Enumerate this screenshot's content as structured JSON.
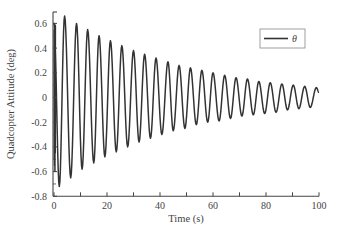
{
  "chart_data": {
    "type": "line",
    "title": "",
    "xlabel": "Time (s)",
    "ylabel": "Quadcopter Attitude (deg)",
    "xlim": [
      0,
      100
    ],
    "ylim": [
      -0.8,
      0.7
    ],
    "xticks": [
      0,
      20,
      40,
      60,
      80,
      100
    ],
    "xticks_minor_step": 10,
    "yticks": [
      0.6,
      0.4,
      0.2,
      0,
      -0.2,
      -0.4,
      -0.6,
      -0.8
    ],
    "xtick_labels": [
      "0",
      "20",
      "40",
      "60",
      "80",
      "100"
    ],
    "ytick_labels": [
      "0.6",
      "0.4",
      "0.2",
      "0",
      "-0.2",
      "-0.4",
      "-0.6",
      "-0.8"
    ],
    "grid": false,
    "legend_position": "upper right",
    "series": [
      {
        "name": "θ",
        "color": "#333333",
        "model": "damped sinusoid: y ≈ 0.72·e^(-0.023 t)·cos(2π t/4.3 + 2.55), with initial transient near t=0",
        "peaks": [
          [
            4,
            0.66
          ],
          [
            8.5,
            0.6
          ],
          [
            12.7,
            0.55
          ],
          [
            17,
            0.5
          ],
          [
            21.3,
            0.46
          ],
          [
            25.6,
            0.42
          ],
          [
            30,
            0.38
          ],
          [
            34.2,
            0.35
          ],
          [
            38.5,
            0.32
          ],
          [
            43,
            0.29
          ],
          [
            47.2,
            0.26
          ],
          [
            51.5,
            0.24
          ],
          [
            55.8,
            0.22
          ],
          [
            60,
            0.2
          ],
          [
            64.4,
            0.18
          ],
          [
            68.7,
            0.16
          ],
          [
            73,
            0.15
          ],
          [
            77.3,
            0.13
          ],
          [
            81.6,
            0.12
          ],
          [
            86,
            0.11
          ],
          [
            90.3,
            0.1
          ],
          [
            94.6,
            0.09
          ],
          [
            99,
            0.08
          ]
        ],
        "troughs": [
          [
            2,
            -0.72
          ],
          [
            6.3,
            -0.65
          ],
          [
            10.6,
            -0.58
          ],
          [
            15,
            -0.53
          ],
          [
            19.2,
            -0.48
          ],
          [
            23.5,
            -0.44
          ],
          [
            27.8,
            -0.4
          ],
          [
            32.1,
            -0.36
          ],
          [
            36.4,
            -0.33
          ],
          [
            40.7,
            -0.3
          ],
          [
            45,
            -0.27
          ],
          [
            49.4,
            -0.25
          ],
          [
            53.7,
            -0.22
          ],
          [
            58,
            -0.2
          ],
          [
            62.3,
            -0.19
          ],
          [
            66.6,
            -0.17
          ],
          [
            70.9,
            -0.15
          ],
          [
            75.2,
            -0.14
          ],
          [
            79.5,
            -0.13
          ],
          [
            83.8,
            -0.12
          ],
          [
            88.1,
            -0.1
          ],
          [
            92.4,
            -0.09
          ],
          [
            96.7,
            -0.08
          ]
        ],
        "start_value": 0.6,
        "end_value": 0.04
      }
    ]
  },
  "legend": {
    "label": "θ"
  },
  "axes": {
    "xlabel": "Time (s)",
    "ylabel": "Quadcopter Attitude (deg)"
  }
}
